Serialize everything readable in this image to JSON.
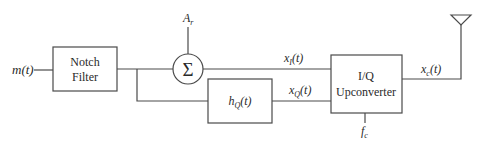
{
  "diagram": {
    "type": "block-diagram",
    "input": {
      "label": "m(t)"
    },
    "blocks": [
      {
        "id": "notch",
        "line1": "Notch",
        "line2": "Filter"
      },
      {
        "id": "sum",
        "symbol": "Σ"
      },
      {
        "id": "hq",
        "label_base": "h",
        "label_sub": "Q",
        "label_arg": "(t)"
      },
      {
        "id": "iq",
        "line1": "I/Q",
        "line2": "Upconverter"
      }
    ],
    "signals": {
      "ar": {
        "base": "A",
        "sub": "r"
      },
      "xi": {
        "base": "x",
        "sub": "I",
        "arg": "(t)"
      },
      "xq": {
        "base": "x",
        "sub": "Q",
        "arg": "(t)"
      },
      "xc": {
        "base": "x",
        "sub": "c",
        "arg": "(t)"
      },
      "fc": {
        "base": "f",
        "sub": "c"
      }
    },
    "output": {
      "icon": "antenna-icon"
    },
    "colors": {
      "line": "#4a4a4a",
      "text": "#2a2a2a",
      "background": "#ffffff"
    }
  }
}
